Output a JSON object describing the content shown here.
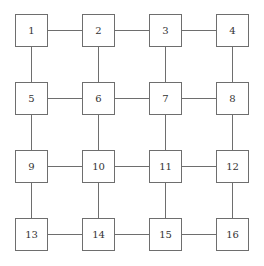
{
  "diagram": {
    "type": "grid-graph",
    "rows": 4,
    "cols": 4,
    "nodes": [
      {
        "id": 1,
        "label": "1",
        "x": 15,
        "y": 14
      },
      {
        "id": 2,
        "label": "2",
        "x": 82,
        "y": 14
      },
      {
        "id": 3,
        "label": "3",
        "x": 149,
        "y": 14
      },
      {
        "id": 4,
        "label": "4",
        "x": 216,
        "y": 14
      },
      {
        "id": 5,
        "label": "5",
        "x": 15,
        "y": 82
      },
      {
        "id": 6,
        "label": "6",
        "x": 82,
        "y": 82
      },
      {
        "id": 7,
        "label": "7",
        "x": 149,
        "y": 82
      },
      {
        "id": 8,
        "label": "8",
        "x": 216,
        "y": 82
      },
      {
        "id": 9,
        "label": "9",
        "x": 15,
        "y": 150
      },
      {
        "id": 10,
        "label": "10",
        "x": 82,
        "y": 150
      },
      {
        "id": 11,
        "label": "11",
        "x": 149,
        "y": 150
      },
      {
        "id": 12,
        "label": "12",
        "x": 216,
        "y": 150
      },
      {
        "id": 13,
        "label": "13",
        "x": 15,
        "y": 218
      },
      {
        "id": 14,
        "label": "14",
        "x": 82,
        "y": 218
      },
      {
        "id": 15,
        "label": "15",
        "x": 149,
        "y": 218
      },
      {
        "id": 16,
        "label": "16",
        "x": 216,
        "y": 218
      }
    ],
    "edges": [
      [
        1,
        2
      ],
      [
        2,
        3
      ],
      [
        3,
        4
      ],
      [
        5,
        6
      ],
      [
        6,
        7
      ],
      [
        7,
        8
      ],
      [
        9,
        10
      ],
      [
        10,
        11
      ],
      [
        11,
        12
      ],
      [
        13,
        14
      ],
      [
        14,
        15
      ],
      [
        15,
        16
      ],
      [
        1,
        5
      ],
      [
        5,
        9
      ],
      [
        9,
        13
      ],
      [
        2,
        6
      ],
      [
        6,
        10
      ],
      [
        10,
        14
      ],
      [
        3,
        7
      ],
      [
        7,
        11
      ],
      [
        11,
        15
      ],
      [
        4,
        8
      ],
      [
        8,
        12
      ],
      [
        12,
        16
      ]
    ],
    "colors": {
      "stroke": "#6e6e6e",
      "text": "#333333",
      "fill": "#ffffff"
    }
  }
}
